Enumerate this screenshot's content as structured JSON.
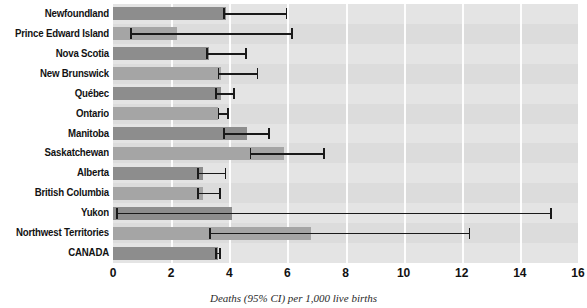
{
  "chart_data": {
    "type": "bar",
    "orientation": "horizontal",
    "title": "",
    "xlabel": "Deaths (95% CI) per 1,000 live births",
    "ylabel": "",
    "xlim": [
      0,
      16
    ],
    "xticks": [
      0,
      2,
      4,
      6,
      8,
      10,
      12,
      14,
      16
    ],
    "xticklabels": [
      "0",
      "2",
      "4",
      "6",
      "8",
      "10",
      "12",
      "14",
      "16"
    ],
    "grid": true,
    "grid_axis": "x",
    "legend": false,
    "error_bars": "95% CI",
    "categories": [
      "Newfoundland",
      "Prince Edward Island",
      "Nova Scotia",
      "New Brunswick",
      "Québec",
      "Ontario",
      "Manitoba",
      "Saskatchewan",
      "Alberta",
      "British Columbia",
      "Yukon",
      "Northwest Territories",
      "CANADA"
    ],
    "values": [
      3.9,
      2.2,
      3.3,
      3.7,
      3.7,
      3.6,
      4.6,
      5.9,
      3.1,
      3.1,
      4.1,
      6.8,
      3.6
    ],
    "ci_low": [
      3.8,
      0.6,
      3.2,
      3.6,
      3.5,
      3.6,
      3.8,
      4.7,
      2.9,
      2.9,
      0.1,
      3.3,
      3.5
    ],
    "ci_high": [
      6.0,
      6.2,
      4.6,
      5.0,
      4.2,
      4.0,
      5.4,
      7.3,
      3.9,
      3.7,
      15.1,
      12.3,
      3.7
    ],
    "colors": {
      "bar": "#8d8d8d",
      "bar_alt": "#a5a5a5",
      "plot_background": "#e4e4e4",
      "band_alt": "#dcdcdc",
      "gridline": "#fdfdfd",
      "error_bar": "#1a1a1a",
      "text": "#121212"
    }
  }
}
